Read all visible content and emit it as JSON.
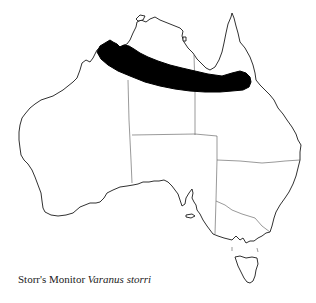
{
  "map": {
    "subject": "Australia distribution map",
    "range_color": "#000000",
    "outline_color": "#1a1a1a",
    "border_color": "#555555",
    "background": "#ffffff"
  },
  "caption": {
    "common_name": "Storr's Monitor",
    "scientific_name": "Varanus storri"
  }
}
